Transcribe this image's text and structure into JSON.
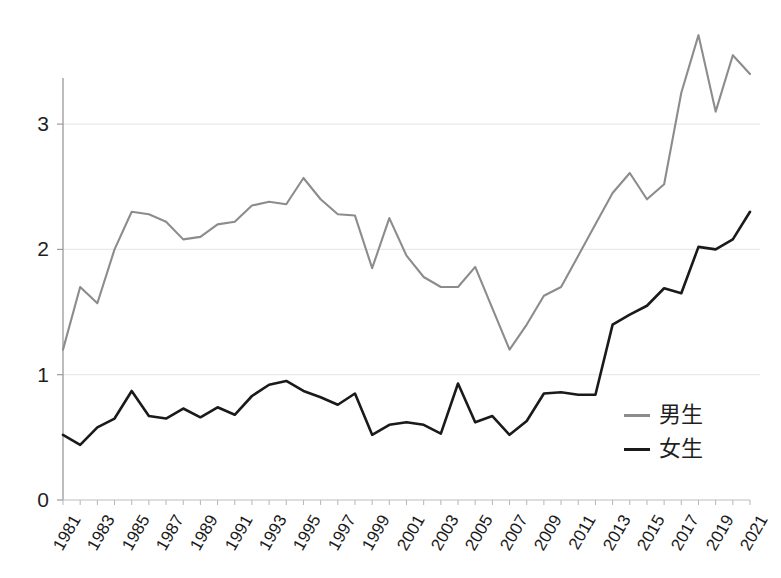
{
  "chart_data": {
    "type": "line",
    "title": "",
    "xlabel": "",
    "ylabel": "",
    "x": [
      1981,
      1982,
      1983,
      1984,
      1985,
      1986,
      1987,
      1988,
      1989,
      1990,
      1991,
      1992,
      1993,
      1994,
      1995,
      1996,
      1997,
      1998,
      1999,
      2000,
      2001,
      2002,
      2003,
      2004,
      2005,
      2006,
      2007,
      2008,
      2009,
      2010,
      2011,
      2012,
      2013,
      2014,
      2015,
      2016,
      2017,
      2018,
      2019,
      2020,
      2021
    ],
    "xtick_labels": [
      "1981",
      "1983",
      "1985",
      "1987",
      "1989",
      "1991",
      "1993",
      "1995",
      "1997",
      "1999",
      "2001",
      "2003",
      "2005",
      "2007",
      "2009",
      "2011",
      "2013",
      "2015",
      "2017",
      "2019",
      "2021"
    ],
    "xtick_values": [
      1981,
      1983,
      1985,
      1987,
      1989,
      1991,
      1993,
      1995,
      1997,
      1999,
      2001,
      2003,
      2005,
      2007,
      2009,
      2011,
      2013,
      2015,
      2017,
      2019,
      2021
    ],
    "ytick_labels": [
      "0",
      "1",
      "2",
      "3"
    ],
    "ytick_values": [
      0,
      1,
      2,
      3
    ],
    "ylim": [
      0,
      3.95
    ],
    "xlim": [
      1981,
      2021
    ],
    "grid": "horizontal",
    "legend_position": "inside-right",
    "series": [
      {
        "name": "男生",
        "color": "#8c8c8c",
        "values": [
          1.2,
          1.7,
          1.57,
          2.0,
          2.3,
          2.28,
          2.22,
          2.08,
          2.1,
          2.2,
          2.22,
          2.35,
          2.38,
          2.36,
          2.57,
          2.4,
          2.28,
          2.27,
          1.85,
          2.25,
          1.95,
          1.78,
          1.7,
          1.7,
          1.86,
          1.53,
          1.2,
          1.4,
          1.63,
          1.7,
          1.95,
          2.2,
          2.45,
          2.61,
          2.4,
          2.52,
          3.25,
          3.71,
          3.1,
          3.55,
          3.4
        ]
      },
      {
        "name": "女生",
        "color": "#1a1a1a",
        "values": [
          0.52,
          0.44,
          0.58,
          0.65,
          0.87,
          0.67,
          0.65,
          0.73,
          0.66,
          0.74,
          0.68,
          0.83,
          0.92,
          0.95,
          0.87,
          0.82,
          0.76,
          0.85,
          0.52,
          0.6,
          0.62,
          0.6,
          0.53,
          0.93,
          0.62,
          0.67,
          0.52,
          0.63,
          0.85,
          0.86,
          0.84,
          0.84,
          1.4,
          1.48,
          1.55,
          1.69,
          1.65,
          2.02,
          2.0,
          2.08,
          2.3
        ]
      }
    ]
  },
  "legend": {
    "items": [
      {
        "label": "男生",
        "color": "#8c8c8c"
      },
      {
        "label": "女生",
        "color": "#1a1a1a"
      }
    ]
  },
  "axes": {
    "y_label_0": "0",
    "y_label_1": "1",
    "y_label_2": "2",
    "y_label_3": "3"
  }
}
